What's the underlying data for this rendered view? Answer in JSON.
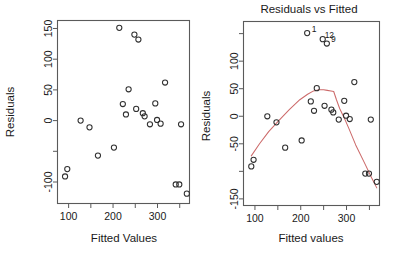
{
  "figure": {
    "type": "scatter-pair",
    "background": "#ffffff",
    "point_color": "#303030",
    "loess_color": "#cc6a6a",
    "axis_color": "#5a5a5a"
  },
  "chart_data": [
    {
      "type": "scatter",
      "panel": "left",
      "title": "",
      "xlabel": "Fitted Values",
      "ylabel": "Residuals",
      "xlim": [
        75,
        372
      ],
      "ylim": [
        -135,
        163
      ],
      "grid": false,
      "legend": "none",
      "xticks": [
        100,
        150,
        200,
        250,
        300,
        350
      ],
      "xticklabels": [
        "100",
        "",
        "200",
        "",
        "300",
        ""
      ],
      "yticks": [
        -100,
        -50,
        0,
        50,
        100,
        150
      ],
      "yticklabels": [
        "-100",
        "",
        "0",
        "50",
        "100",
        "150"
      ],
      "x": [
        92,
        97,
        127,
        147,
        166,
        202,
        214,
        222,
        229,
        235,
        248,
        252,
        257,
        267,
        271,
        283,
        295,
        299,
        307,
        317,
        341,
        349,
        353,
        366
      ],
      "y": [
        -91,
        -79,
        0,
        -11,
        -57,
        -44,
        151,
        27,
        10,
        51,
        140,
        19,
        132,
        12,
        7,
        -6,
        28,
        1,
        -5,
        62,
        -104,
        -104,
        -6,
        -119
      ]
    },
    {
      "type": "scatter",
      "panel": "right",
      "title": "Residuals vs Fitted",
      "xlabel": "Fitted values",
      "ylabel": "Residuals",
      "xlim": [
        75,
        372
      ],
      "ylim": [
        -162,
        172
      ],
      "grid": false,
      "legend": "none",
      "xticks": [
        100,
        150,
        200,
        250,
        300,
        350
      ],
      "xticklabels": [
        "100",
        "",
        "200",
        "",
        "300",
        ""
      ],
      "yticks": [
        -150,
        -100,
        -50,
        0,
        50,
        100,
        150
      ],
      "yticklabels": [
        "-150",
        "",
        "-50",
        "0",
        "50",
        "100",
        ""
      ],
      "x": [
        92,
        97,
        127,
        147,
        166,
        202,
        214,
        222,
        229,
        235,
        248,
        252,
        257,
        267,
        271,
        283,
        295,
        299,
        307,
        317,
        341,
        349,
        353,
        366
      ],
      "y": [
        -91,
        -79,
        0,
        -11,
        -57,
        -44,
        151,
        27,
        10,
        51,
        140,
        19,
        132,
        12,
        7,
        -6,
        28,
        1,
        -5,
        62,
        -104,
        -104,
        -6,
        -119
      ],
      "point_labels": [
        {
          "text": "1",
          "x": 215,
          "y": 151
        },
        {
          "text": "12",
          "x": 243,
          "y": 140
        },
        {
          "text": "9",
          "x": 257,
          "y": 132
        }
      ],
      "series": [
        {
          "name": "loess smoother",
          "color": "#cc6a6a",
          "x": [
            92,
            110,
            130,
            152,
            175,
            198,
            215,
            228,
            240,
            250,
            258,
            266,
            272,
            278,
            285,
            295,
            305,
            320,
            340,
            355,
            366
          ],
          "y": [
            -72,
            -50,
            -28,
            -8,
            12,
            30,
            40,
            46,
            48,
            48,
            47,
            46,
            45,
            30,
            14,
            -3,
            -22,
            -52,
            -86,
            -112,
            -130
          ]
        }
      ]
    }
  ]
}
